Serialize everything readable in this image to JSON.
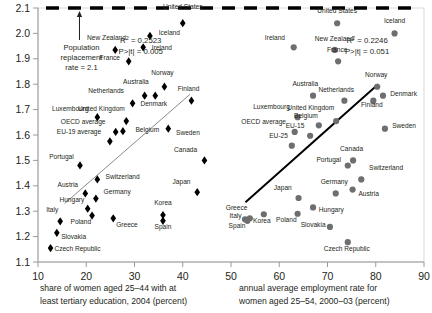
{
  "chart_data": {
    "type": "scatter",
    "title": "",
    "grid": false,
    "legend_position": "none",
    "ylabel": "total fertility rate",
    "ylim": [
      1.1,
      2.1
    ],
    "yticks": [
      "1.1",
      "1.2",
      "1.3",
      "1.4",
      "1.5",
      "1.6",
      "1.7",
      "1.8",
      "1.9",
      "2.0",
      "2.1"
    ],
    "xlim": [
      10,
      90
    ],
    "xticks": [
      "10",
      "20",
      "30",
      "40",
      "50",
      "60",
      "70",
      "80",
      "90"
    ],
    "xlabel_left": "share of women aged 25–44  with at least tertiary education, 2004 (percent)",
    "xlabel_left_line1": "share of women aged 25–44  with at",
    "xlabel_left_line2": "least tertiary education, 2004 (percent)",
    "xlabel_right": "annual average employment rate for women aged 25–54, 2000–03 (percent)",
    "xlabel_right_line1": "annual average employment rate for",
    "xlabel_right_line2": "women aged 25–54, 2000–03 (percent)",
    "reference_line": {
      "value": 2.1,
      "style": "dashed",
      "annotation_line1": "Population",
      "annotation_line2": "replacement",
      "annotation_line3": "rate = 2.1"
    },
    "series": [
      {
        "name": "tertiary education",
        "marker": "diamond",
        "color": "#000000",
        "stats": {
          "r2_label": "R",
          "r2_sup": "2",
          "r2_value": " = 0.2523",
          "p_value": "P>|t| = 0.005"
        },
        "trendline": {
          "x1": 15.5,
          "y1": 1.33,
          "x2": 41.5,
          "y2": 1.76,
          "color": "#8a8a8a",
          "width": 1
        },
        "points": [
          {
            "label": "United States",
            "x": 40.0,
            "y": 2.04,
            "lx": 40.0,
            "ly": 2.095,
            "anchor": "middle"
          },
          {
            "label": "Iceland",
            "x": 33.2,
            "y": 1.99,
            "lx": 35.0,
            "ly": 1.995,
            "anchor": "start"
          },
          {
            "label": "Ireland",
            "x": 31.8,
            "y": 1.945,
            "lx": 33.6,
            "ly": 1.935,
            "anchor": "start"
          },
          {
            "label": "New Zealand",
            "x": 26.0,
            "y": 1.935,
            "lx": 24.2,
            "ly": 1.975,
            "anchor": "middle"
          },
          {
            "label": "France",
            "x": 28.8,
            "y": 1.89,
            "lx": 27.0,
            "ly": 1.895,
            "anchor": "end"
          },
          {
            "label": "Norway",
            "x": 36.2,
            "y": 1.79,
            "lx": 35.8,
            "ly": 1.835,
            "anchor": "middle"
          },
          {
            "label": "Australia",
            "x": 32.1,
            "y": 1.755,
            "lx": 30.3,
            "ly": 1.8,
            "anchor": "middle"
          },
          {
            "label": "Finland",
            "x": 41.8,
            "y": 1.735,
            "lx": 41.2,
            "ly": 1.775,
            "anchor": "middle"
          },
          {
            "label": "Denmark",
            "x": 34.3,
            "y": 1.755,
            "lx": 34.0,
            "ly": 1.715,
            "anchor": "middle"
          },
          {
            "label": "Netherlands",
            "x": 29.6,
            "y": 1.725,
            "lx": 27.8,
            "ly": 1.765,
            "anchor": "end"
          },
          {
            "label": "Luxembourg",
            "x": 22.3,
            "y": 1.67,
            "lx": 20.5,
            "ly": 1.695,
            "anchor": "end"
          },
          {
            "label": "United Kingdom",
            "x": 28.3,
            "y": 1.655,
            "lx": 28.0,
            "ly": 1.693,
            "anchor": "end"
          },
          {
            "label": "Belgium",
            "x": 27.6,
            "y": 1.615,
            "lx": 30.2,
            "ly": 1.612,
            "anchor": "start"
          },
          {
            "label": "Sweden",
            "x": 37.0,
            "y": 1.625,
            "lx": 38.6,
            "ly": 1.6,
            "anchor": "start"
          },
          {
            "label": "OECD average",
            "x": 26.1,
            "y": 1.612,
            "lx": 24.0,
            "ly": 1.645,
            "anchor": "end"
          },
          {
            "label": "EU-19 average",
            "x": 24.9,
            "y": 1.575,
            "lx": 23.1,
            "ly": 1.605,
            "anchor": "end"
          },
          {
            "label": "Canada",
            "x": 44.5,
            "y": 1.5,
            "lx": 43.0,
            "ly": 1.532,
            "anchor": "end"
          },
          {
            "label": "Portugal",
            "x": 18.7,
            "y": 1.48,
            "lx": 17.4,
            "ly": 1.507,
            "anchor": "end"
          },
          {
            "label": "Switzerland",
            "x": 22.3,
            "y": 1.425,
            "lx": 24.0,
            "ly": 1.425,
            "anchor": "start"
          },
          {
            "label": "Japan",
            "x": 43.0,
            "y": 1.375,
            "lx": 41.6,
            "ly": 1.408,
            "anchor": "end"
          },
          {
            "label": "Austria",
            "x": 19.8,
            "y": 1.37,
            "lx": 18.3,
            "ly": 1.397,
            "anchor": "end"
          },
          {
            "label": "Germany",
            "x": 22.0,
            "y": 1.35,
            "lx": 23.6,
            "ly": 1.368,
            "anchor": "start"
          },
          {
            "label": "Hungary",
            "x": 20.3,
            "y": 1.31,
            "lx": 19.6,
            "ly": 1.338,
            "anchor": "end"
          },
          {
            "label": "Korea",
            "x": 35.9,
            "y": 1.285,
            "lx": 35.9,
            "ly": 1.325,
            "anchor": "middle"
          },
          {
            "label": "Spain",
            "x": 35.9,
            "y": 1.262,
            "lx": 35.9,
            "ly": 1.228,
            "anchor": "middle"
          },
          {
            "label": "Poland",
            "x": 21.2,
            "y": 1.283,
            "lx": 21.0,
            "ly": 1.248,
            "anchor": "end"
          },
          {
            "label": "Greece",
            "x": 25.6,
            "y": 1.272,
            "lx": 26.2,
            "ly": 1.238,
            "anchor": "start"
          },
          {
            "label": "Italy",
            "x": 14.6,
            "y": 1.26,
            "lx": 14.2,
            "ly": 1.295,
            "anchor": "end"
          },
          {
            "label": "Slovakia",
            "x": 13.9,
            "y": 1.215,
            "lx": 14.8,
            "ly": 1.192,
            "anchor": "start"
          },
          {
            "label": "Czech Republic",
            "x": 12.6,
            "y": 1.155,
            "lx": 13.4,
            "ly": 1.145,
            "anchor": "start"
          }
        ]
      },
      {
        "name": "employment rate",
        "marker": "circle",
        "color": "#6d6e70",
        "stats": {
          "r2_label": "R",
          "r2_sup": "2",
          "r2_value": " = 0.2246",
          "p_value": "P>|t| = 0.051"
        },
        "trendline": {
          "x1": 53.0,
          "y1": 1.335,
          "x2": 80.5,
          "y2": 1.8,
          "color": "#000000",
          "width": 2
        },
        "points": [
          {
            "label": "United States",
            "x": 72.0,
            "y": 2.04,
            "lx": 72.0,
            "ly": 2.082,
            "anchor": "middle"
          },
          {
            "label": "Iceland",
            "x": 83.9,
            "y": 2.0,
            "lx": 83.9,
            "ly": 2.042,
            "anchor": "middle"
          },
          {
            "label": "Ireland",
            "x": 63.0,
            "y": 1.945,
            "lx": 61.2,
            "ly": 1.975,
            "anchor": "end"
          },
          {
            "label": "New Zealand",
            "x": 71.5,
            "y": 1.935,
            "lx": 71.4,
            "ly": 1.972,
            "anchor": "middle"
          },
          {
            "label": "France",
            "x": 72.2,
            "y": 1.89,
            "lx": 72.0,
            "ly": 1.928,
            "anchor": "middle"
          },
          {
            "label": "Norway",
            "x": 80.3,
            "y": 1.79,
            "lx": 80.1,
            "ly": 1.828,
            "anchor": "middle"
          },
          {
            "label": "Denmark",
            "x": 81.5,
            "y": 1.755,
            "lx": 83.0,
            "ly": 1.752,
            "anchor": "start"
          },
          {
            "label": "Netherlands",
            "x": 73.5,
            "y": 1.735,
            "lx": 71.8,
            "ly": 1.768,
            "anchor": "middle"
          },
          {
            "label": "Australia",
            "x": 67.0,
            "y": 1.755,
            "lx": 65.4,
            "ly": 1.792,
            "anchor": "middle"
          },
          {
            "label": "Finland",
            "x": 79.5,
            "y": 1.735,
            "lx": 79.2,
            "ly": 1.712,
            "anchor": "middle"
          },
          {
            "label": "United Kingdom",
            "x": 71.8,
            "y": 1.655,
            "lx": 71.4,
            "ly": 1.697,
            "anchor": "end"
          },
          {
            "label": "Luxembourg",
            "x": 63.8,
            "y": 1.67,
            "lx": 62.2,
            "ly": 1.703,
            "anchor": "end"
          },
          {
            "label": "Belgium",
            "x": 68.2,
            "y": 1.638,
            "lx": 68.0,
            "ly": 1.668,
            "anchor": "end"
          },
          {
            "label": "Sweden",
            "x": 81.9,
            "y": 1.625,
            "lx": 83.4,
            "ly": 1.628,
            "anchor": "start"
          },
          {
            "label": "OECD average",
            "x": 63.2,
            "y": 1.612,
            "lx": 61.4,
            "ly": 1.642,
            "anchor": "end"
          },
          {
            "label": "EU-15",
            "x": 66.4,
            "y": 1.597,
            "lx": 65.2,
            "ly": 1.628,
            "anchor": "end"
          },
          {
            "label": "EU-25",
            "x": 62.6,
            "y": 1.558,
            "lx": 61.8,
            "ly": 1.588,
            "anchor": "end"
          },
          {
            "label": "Canada",
            "x": 75.3,
            "y": 1.5,
            "lx": 75.0,
            "ly": 1.538,
            "anchor": "middle"
          },
          {
            "label": "Portugal",
            "x": 74.2,
            "y": 1.48,
            "lx": 72.8,
            "ly": 1.492,
            "anchor": "end"
          },
          {
            "label": "Switzerland",
            "x": 77.0,
            "y": 1.425,
            "lx": 78.6,
            "ly": 1.463,
            "anchor": "start"
          },
          {
            "label": "Austria",
            "x": 75.2,
            "y": 1.385,
            "lx": 76.4,
            "ly": 1.358,
            "anchor": "start"
          },
          {
            "label": "Germany",
            "x": 71.7,
            "y": 1.37,
            "lx": 71.4,
            "ly": 1.408,
            "anchor": "middle"
          },
          {
            "label": "Japan",
            "x": 64.0,
            "y": 1.352,
            "lx": 62.6,
            "ly": 1.385,
            "anchor": "end"
          },
          {
            "label": "Hungary",
            "x": 67.0,
            "y": 1.315,
            "lx": 68.2,
            "ly": 1.295,
            "anchor": "start"
          },
          {
            "label": "Poland",
            "x": 63.8,
            "y": 1.29,
            "lx": 63.6,
            "ly": 1.258,
            "anchor": "end"
          },
          {
            "label": "Korea",
            "x": 56.8,
            "y": 1.288,
            "lx": 56.4,
            "ly": 1.255,
            "anchor": "middle"
          },
          {
            "label": "Greece",
            "x": 53.9,
            "y": 1.272,
            "lx": 53.4,
            "ly": 1.305,
            "anchor": "end"
          },
          {
            "label": "Italy",
            "x": 52.9,
            "y": 1.268,
            "lx": 52.2,
            "ly": 1.272,
            "anchor": "end"
          },
          {
            "label": "Spain",
            "x": 53.4,
            "y": 1.262,
            "lx": 53.0,
            "ly": 1.232,
            "anchor": "end"
          },
          {
            "label": "Slovakia",
            "x": 70.5,
            "y": 1.238,
            "lx": 69.6,
            "ly": 1.238,
            "anchor": "end"
          },
          {
            "label": "Czech Republic",
            "x": 74.2,
            "y": 1.178,
            "lx": 74.0,
            "ly": 1.142,
            "anchor": "middle"
          }
        ]
      }
    ]
  }
}
